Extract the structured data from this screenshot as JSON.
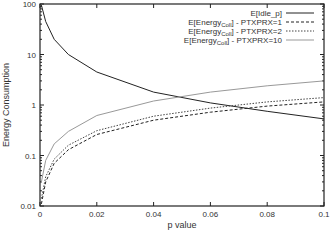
{
  "chart_data": {
    "type": "line",
    "title": "",
    "xlabel": "p value",
    "ylabel": "Energy Consumption",
    "xlim": [
      0,
      0.1
    ],
    "ylim": [
      0.01,
      100
    ],
    "yscale": "log",
    "grid": false,
    "legend_position": "top-right",
    "x_ticks": [
      "0",
      "0.02",
      "0.04",
      "0.06",
      "0.08",
      "0.1"
    ],
    "y_ticks": [
      "0.01",
      "0.1",
      "1",
      "10",
      "100"
    ],
    "series": [
      {
        "name": "E[Idle_p]",
        "style": "solid",
        "x": [
          0.0005,
          0.002,
          0.005,
          0.01,
          0.02,
          0.04,
          0.06,
          0.08,
          0.1
        ],
        "y": [
          95,
          45,
          20,
          10,
          4.5,
          1.8,
          1.1,
          0.75,
          0.53
        ]
      },
      {
        "name": "E[Energy_Coll] - PTXPRX=1",
        "style": "dashed",
        "x": [
          0.0005,
          0.002,
          0.005,
          0.01,
          0.02,
          0.04,
          0.06,
          0.08,
          0.1
        ],
        "y": [
          0.011,
          0.03,
          0.07,
          0.13,
          0.26,
          0.5,
          0.72,
          0.95,
          1.15
        ]
      },
      {
        "name": "E[Energy_Coll] - PTXPRX=2",
        "style": "dotted",
        "x": [
          0.0005,
          0.002,
          0.005,
          0.01,
          0.02,
          0.04,
          0.06,
          0.08,
          0.1
        ],
        "y": [
          0.014,
          0.038,
          0.085,
          0.16,
          0.31,
          0.6,
          0.87,
          1.15,
          1.4
        ]
      },
      {
        "name": "E[Energy_Coll] - PTXPRX=10",
        "style": "solid-light",
        "x": [
          0.0005,
          0.002,
          0.005,
          0.01,
          0.02,
          0.04,
          0.06,
          0.08,
          0.1
        ],
        "y": [
          0.03,
          0.08,
          0.17,
          0.3,
          0.62,
          1.2,
          1.8,
          2.4,
          3.0
        ]
      }
    ]
  },
  "legend": [
    {
      "prefix": "E[Idle_p]",
      "sub": "",
      "suffix": ""
    },
    {
      "prefix": "E[Energy",
      "sub": "Coll",
      "suffix": "] - PTXPRX=1"
    },
    {
      "prefix": "E[Energy",
      "sub": "Coll",
      "suffix": "] - PTXPRX=2"
    },
    {
      "prefix": "E[Energy",
      "sub": "Coll",
      "suffix": "] - PTXPRX=10"
    }
  ]
}
